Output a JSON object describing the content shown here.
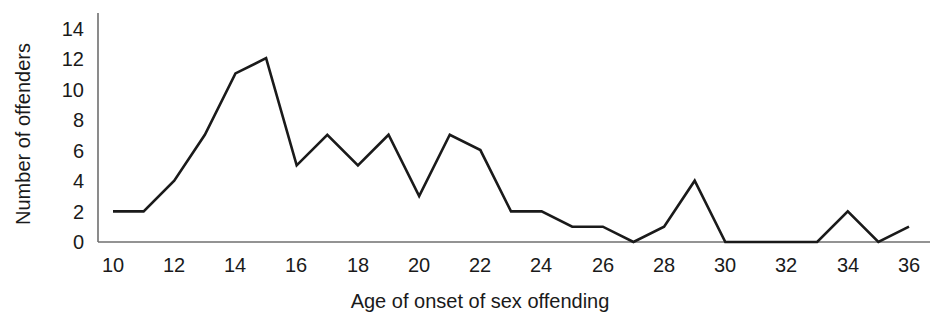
{
  "chart_data": {
    "type": "line",
    "title": "",
    "subtitle": "",
    "xlabel": "Age of onset of sex offending",
    "ylabel": "Number of offenders",
    "x": [
      10,
      11,
      12,
      13,
      14,
      15,
      16,
      17,
      18,
      19,
      20,
      21,
      22,
      23,
      24,
      25,
      26,
      27,
      28,
      29,
      30,
      31,
      32,
      33,
      34,
      35,
      36
    ],
    "values": [
      2,
      2,
      4,
      7,
      11,
      12,
      5,
      7,
      5,
      7,
      3,
      7,
      6,
      2,
      2,
      1,
      1,
      0,
      1,
      4,
      0,
      0,
      0,
      0,
      2,
      0,
      1
    ],
    "series": [
      {
        "name": "Number of offenders",
        "values": [
          2,
          2,
          4,
          7,
          11,
          12,
          5,
          7,
          5,
          7,
          3,
          7,
          6,
          2,
          2,
          1,
          1,
          0,
          1,
          4,
          0,
          0,
          0,
          0,
          2,
          0,
          1
        ]
      }
    ],
    "xlim": [
      10,
      36
    ],
    "ylim": [
      0,
      14
    ],
    "xticks": [
      10,
      12,
      14,
      16,
      18,
      20,
      22,
      24,
      26,
      28,
      30,
      32,
      34,
      36
    ],
    "yticks": [
      0,
      2,
      4,
      6,
      8,
      10,
      12,
      14
    ],
    "xtick_labels": [
      "10",
      "12",
      "14",
      "16",
      "18",
      "20",
      "22",
      "24",
      "26",
      "28",
      "30",
      "32",
      "34",
      "36"
    ],
    "ytick_labels": [
      "0",
      "2",
      "4",
      "6",
      "8",
      "10",
      "12",
      "14"
    ],
    "grid": false,
    "legend": false,
    "legend_position": "none",
    "line_color": "#1a1a1a",
    "axis_color": "#6f6f6f",
    "background_color": "#ffffff",
    "annotations": []
  }
}
